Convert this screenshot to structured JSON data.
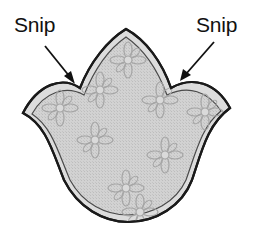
{
  "figure": {
    "labels": [
      {
        "id": "left",
        "text": "Snip"
      },
      {
        "id": "right",
        "text": "Snip"
      }
    ],
    "colors": {
      "background": "#ffffff",
      "outline": "#1a1a1a",
      "seam_band": "#d9d9d9",
      "fabric": "#cfcfcf",
      "flower": "#a8a8a8",
      "label": "#111111",
      "arrow": "#111111"
    }
  }
}
